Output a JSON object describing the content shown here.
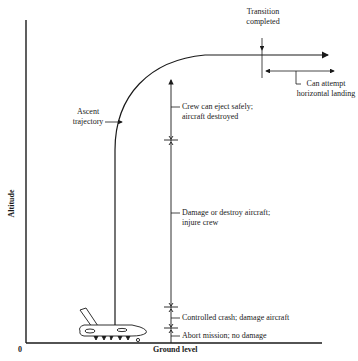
{
  "axes": {
    "y_label": "Altitude",
    "x_label": "Ground level",
    "origin_label": "0"
  },
  "annotations": {
    "transition_line1": "Transition",
    "transition_line2": "completed",
    "landing_line1": "Can attempt",
    "landing_line2": "horizontal landing",
    "ascent_line1": "Ascent",
    "ascent_line2": "trajectory"
  },
  "zones": [
    {
      "line1": "Crew can eject safely;",
      "line2": "aircraft destroyed"
    },
    {
      "line1": "Damage or destroy aircraft;",
      "line2": "injure crew"
    },
    {
      "line1": "Controlled crash; damage aircraft",
      "line2": ""
    },
    {
      "line1": "Abort mission; no damage",
      "line2": ""
    }
  ],
  "colors": {
    "ink": "#1a1a1a",
    "background": "#ffffff"
  }
}
